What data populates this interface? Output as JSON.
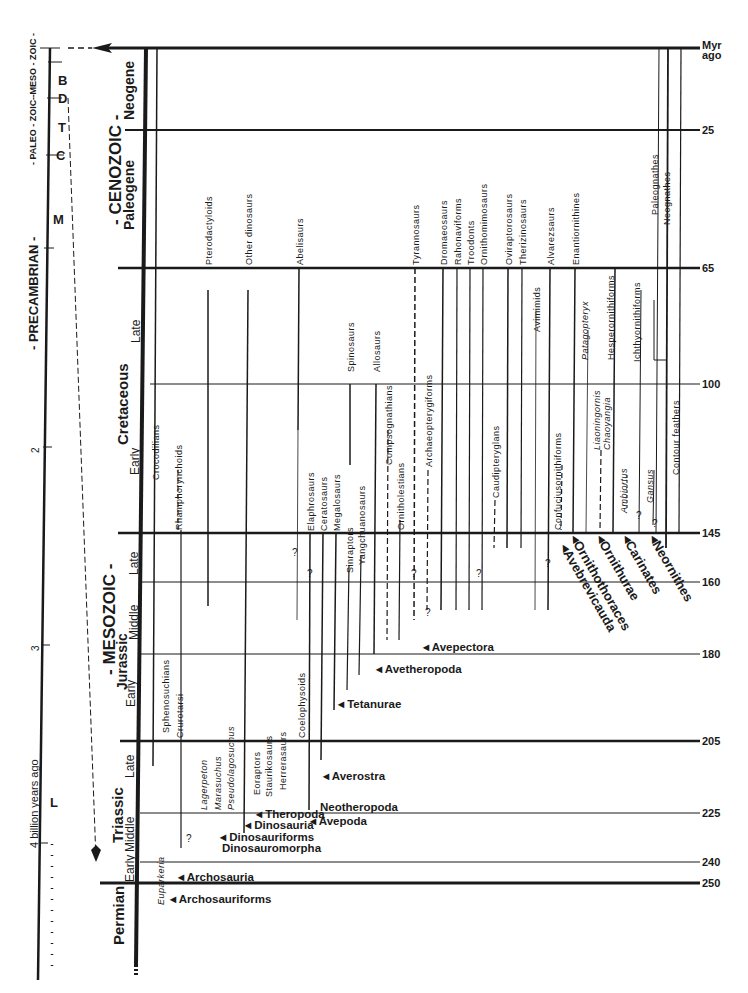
{
  "left_timeline": {
    "eras": [
      {
        "label": "- PALEO - ZOIC -",
        "y": 170
      },
      {
        "label": "- MESO - ZOIC -",
        "y": 80
      },
      {
        "label": "- PRECAMBRIAN -",
        "y": 420
      }
    ],
    "periods": [
      "B",
      "D",
      "T",
      "C",
      "M",
      "L"
    ],
    "ticks": [
      "1",
      "2",
      "3",
      "4"
    ],
    "axis_label": "4 billion years ago"
  },
  "eras": {
    "cenozoic": "- CENOZOIC -",
    "mesozoic": "- MESOZOIC -"
  },
  "periods": {
    "neogene": "Neogene",
    "paleogene": "Paleogene",
    "cretaceous": "Cretaceous",
    "jurassic": "Jurassic",
    "triassic": "Triassic",
    "permian": "Permian"
  },
  "epochs": {
    "cret_late": "Late",
    "cret_early": "Early",
    "jur_late": "Late",
    "jur_middle": "Middle",
    "jur_early": "Early",
    "tri_late": "Late",
    "tri_middle": "Middle",
    "tri_early": "Early"
  },
  "time_scale": {
    "unit_line1": "Myr",
    "unit_line2": "ago",
    "ticks": [
      {
        "label": "25",
        "y": 130
      },
      {
        "label": "65",
        "y": 268
      },
      {
        "label": "100",
        "y": 384
      },
      {
        "label": "145",
        "y": 533
      },
      {
        "label": "160",
        "y": 582
      },
      {
        "label": "180",
        "y": 654
      },
      {
        "label": "205",
        "y": 741
      },
      {
        "label": "225",
        "y": 813
      },
      {
        "label": "240",
        "y": 862
      },
      {
        "label": "250",
        "y": 883
      }
    ]
  },
  "taxa": {
    "crocodilians": "Crocodilians",
    "rhamphorynchoids": "Rhamphorynchoids",
    "pterodactyloids": "Pterodactyloids",
    "other_dinosaurs": "Other dinosaurs",
    "abelisaurs": "Abelisaurs",
    "elaphrosaurs": "Elaphrosaurs",
    "ceratosaurs": "Ceratosaurs",
    "megalosaurs": "Megalosaurs",
    "sinraptors": "Sinraptors",
    "yangchuanosaurs": "Yangchuanosaurs",
    "spinosaurs": "Spinosaurs",
    "allosaurs": "Allosaurs",
    "compsognathians": "Compsognathians",
    "ornitholestians": "Ornitholestians",
    "tyrannosaurs": "Tyrannosaurs",
    "archaeopterygiforms": "Archaeopterygiforms",
    "dromaeosaurs": "Dromaeosaurs",
    "rahonaviforms": "Rahonaviforms",
    "troodonts": "Troodonts",
    "ornithomimosaurs": "Ornithomimosaurs",
    "caudipteryglans": "Caudipteryglans",
    "oviraptorosaurs": "Oviraptorosaurs",
    "therizinosaurs": "Therizinosaurs",
    "avimimids": "Avimimids",
    "alvarezsaurs": "Alvarezsaurs",
    "confuciusornithiforms": "Confuciusornithiforms",
    "enantiornithines": "Enantiornithines",
    "patagopteryx": "Patagopteryx",
    "liaoningornis": "Liaoningornis",
    "chaoyangia": "Chaoyangia",
    "hesperornithiforms": "Hesperornithiforms",
    "ambiortus": "Ambiortus",
    "ichthyornithiforms": "Ichthyornithiforms",
    "gansus": "Gansus",
    "paleognathes": "Paleognathes",
    "neognathes": "Neognathes",
    "contour_feathers": "Contour feathers",
    "sphenosuchians": "Sphenosuchians",
    "crurotarsi": "Crurotarsi",
    "lagerpeton": "Lagerpeton",
    "marasuchus": "Marasuchus",
    "pseudolagosuchus": "Pseudolagosuchus",
    "eoraptors": "Eoraptors",
    "staurikosaurs": "Staurikosaurs",
    "herrerasaurs": "Herrerasaurs",
    "coelophysoids": "Coelophysoids",
    "euparkeria": "Euparkeria"
  },
  "clades": {
    "archosauriforms": "Archosauriforms",
    "archosauria": "Archosauria",
    "dinosauromorpha": "Dinosauromorpha",
    "dinosauriforms": "Dinosauriforms",
    "dinosauria": "Dinosauria",
    "theropoda": "Theropoda",
    "avepoda": "Avepoda",
    "neotheropoda": "Neotheropoda",
    "averostra": "Averostra",
    "tetanurae": "Tetanurae",
    "avetheropoda": "Avetheropoda",
    "avepectora": "Avepectora",
    "avebrevicauda": "Avebrevicauda",
    "ornithothoraces": "Ornithothoraces",
    "ornithurae": "Ornithurae",
    "carinates": "Carinates",
    "neornithes": "Neornithes"
  },
  "uncertain_mark": "?"
}
